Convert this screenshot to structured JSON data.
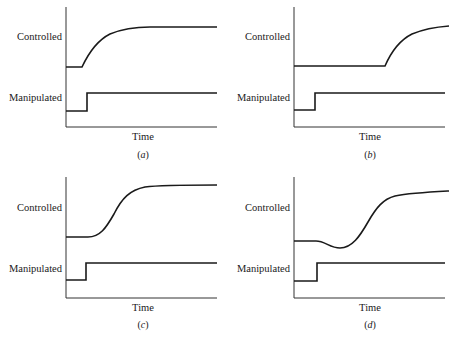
{
  "figure": {
    "panels": [
      {
        "id": "a",
        "caption_letter": "a",
        "y_label_top": "Controlled",
        "y_label_bottom": "Manipulated",
        "x_label": "Time",
        "response_type": "first-order lag, immediate response to step"
      },
      {
        "id": "b",
        "caption_letter": "b",
        "y_label_top": "Controlled",
        "y_label_bottom": "Manipulated",
        "x_label": "Time",
        "response_type": "pure dead time followed by first-order rise"
      },
      {
        "id": "c",
        "caption_letter": "c",
        "y_label_top": "Controlled",
        "y_label_bottom": "Manipulated",
        "x_label": "Time",
        "response_type": "higher-order S-shaped (sigmoidal) response"
      },
      {
        "id": "d",
        "caption_letter": "d",
        "y_label_top": "Controlled",
        "y_label_bottom": "Manipulated",
        "x_label": "Time",
        "response_type": "inverse response: initial dip then rise"
      }
    ],
    "colors": {
      "line": "#1a1a1a",
      "axis": "#333333",
      "background": "#ffffff"
    }
  }
}
